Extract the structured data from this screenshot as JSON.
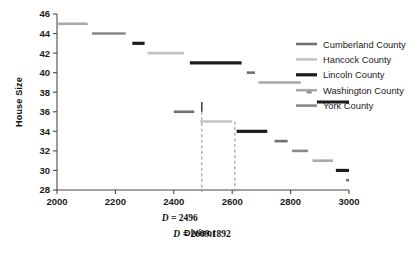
{
  "chart_data": {
    "type": "line",
    "title": "",
    "xlabel": "Divisor",
    "ylabel": "House Size",
    "xlim": [
      2000,
      3000
    ],
    "ylim": [
      28,
      46
    ],
    "xticks": [
      2000,
      2200,
      2400,
      2600,
      2800,
      3000
    ],
    "xticklabels": [
      "2000",
      "2200",
      "2400",
      "2600",
      "2800",
      "3000"
    ],
    "yticks": [
      28,
      30,
      32,
      34,
      36,
      38,
      40,
      42,
      44,
      46
    ],
    "yticklabels": [
      "28",
      "30",
      "32",
      "34",
      "36",
      "38",
      "40",
      "42",
      "44",
      "46"
    ],
    "grid": false,
    "legend_position": "right",
    "series": [
      {
        "name": "Cumberland County",
        "color": "#707070",
        "width": 2.6
      },
      {
        "name": "Hancock County",
        "color": "#c4c4c4",
        "width": 2.6
      },
      {
        "name": "Lincoln County",
        "color": "#1c1c1c",
        "width": 3.2
      },
      {
        "name": "Washington County",
        "color": "#a8a8a8",
        "width": 2.6
      },
      {
        "name": "York County",
        "color": "#8a8a8a",
        "width": 2.6
      }
    ],
    "segments": [
      {
        "series": "Washington County",
        "y": 45.0,
        "x0": 2000,
        "x1": 2105
      },
      {
        "series": "York County",
        "y": 44.0,
        "x0": 2120,
        "x1": 2235
      },
      {
        "series": "Lincoln County",
        "y": 43.0,
        "x0": 2258,
        "x1": 2300
      },
      {
        "series": "Hancock County",
        "y": 42.0,
        "x0": 2310,
        "x1": 2435
      },
      {
        "series": "Lincoln County",
        "y": 41.0,
        "x0": 2455,
        "x1": 2632
      },
      {
        "series": "Cumberland County",
        "y": 40.0,
        "x0": 2650,
        "x1": 2678
      },
      {
        "series": "Washington County",
        "y": 39.0,
        "x0": 2690,
        "x1": 2835
      },
      {
        "series": "York County",
        "y": 38.0,
        "x0": 2855,
        "x1": 2872
      },
      {
        "series": "Lincoln County",
        "y": 37.0,
        "x0": 2890,
        "x1": 3000
      },
      {
        "series": "Cumberland County",
        "y": 36.0,
        "x0": 2400,
        "x1": 2470
      },
      {
        "series": "Hancock County",
        "y": 35.0,
        "x0": 2490,
        "x1": 2600
      },
      {
        "series": "Lincoln County",
        "y": 34.0,
        "x0": 2615,
        "x1": 2720
      },
      {
        "series": "Cumberland County",
        "y": 33.0,
        "x0": 2745,
        "x1": 2790
      },
      {
        "series": "York County",
        "y": 32.0,
        "x0": 2805,
        "x1": 2860
      },
      {
        "series": "Washington County",
        "y": 31.0,
        "x0": 2875,
        "x1": 2945
      },
      {
        "series": "Lincoln County",
        "y": 30.0,
        "x0": 2955,
        "x1": 3000
      },
      {
        "series": "Cumberland County",
        "y": 29.0,
        "x0": 2990,
        "x1": 3000
      }
    ],
    "annotations": [
      {
        "name": "divisor-line-1",
        "label_prefix": "D",
        "label_eq": "= 2496",
        "value": 2496,
        "type": "vline-dashed",
        "y_top": 36.0
      },
      {
        "name": "divisor-line-2",
        "label_prefix": "D",
        "label_eq": "= 2609.1892",
        "value": 2609.1892,
        "type": "vline-dashed",
        "y_top": 35.0
      }
    ]
  },
  "legend": {
    "items": [
      {
        "label": "Cumberland County"
      },
      {
        "label": "Hancock County"
      },
      {
        "label": "Lincoln County"
      },
      {
        "label": "Washington County"
      },
      {
        "label": "York County"
      }
    ]
  }
}
